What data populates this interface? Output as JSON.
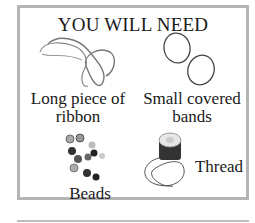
{
  "title": "YOU WILL NEED",
  "items": [
    {
      "label_line1": "Long piece of",
      "label_line2": "ribbon",
      "icon": "ribbon-icon"
    },
    {
      "label_line1": "Small covered",
      "label_line2": "bands",
      "icon": "bands-icon"
    },
    {
      "label_line1": "Beads",
      "icon": "beads-icon"
    },
    {
      "label_line1": "Thread",
      "icon": "thread-icon"
    }
  ],
  "colors": {
    "border": "#b4b4b4",
    "text": "#1a1a1a"
  }
}
